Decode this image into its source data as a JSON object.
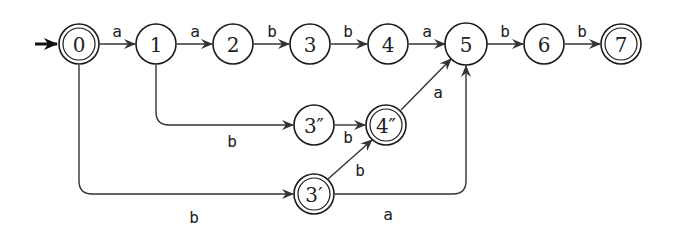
{
  "diagram": {
    "type": "finite-automaton",
    "nodes": [
      {
        "id": "0",
        "label": "0",
        "accepting": true,
        "initial": true
      },
      {
        "id": "1",
        "label": "1",
        "accepting": false
      },
      {
        "id": "2",
        "label": "2",
        "accepting": false
      },
      {
        "id": "3",
        "label": "3",
        "accepting": false
      },
      {
        "id": "4",
        "label": "4",
        "accepting": false
      },
      {
        "id": "5",
        "label": "5",
        "accepting": false
      },
      {
        "id": "6",
        "label": "6",
        "accepting": false
      },
      {
        "id": "7",
        "label": "7",
        "accepting": true
      },
      {
        "id": "3pp",
        "label": "3″",
        "accepting": false
      },
      {
        "id": "4pp",
        "label": "4″",
        "accepting": true
      },
      {
        "id": "3p",
        "label": "3′",
        "accepting": true
      }
    ],
    "edges": [
      {
        "from": "0",
        "to": "1",
        "label": "a"
      },
      {
        "from": "1",
        "to": "2",
        "label": "a"
      },
      {
        "from": "2",
        "to": "3",
        "label": "b"
      },
      {
        "from": "3",
        "to": "4",
        "label": "b"
      },
      {
        "from": "4",
        "to": "5",
        "label": "a"
      },
      {
        "from": "5",
        "to": "6",
        "label": "b"
      },
      {
        "from": "6",
        "to": "7",
        "label": "b"
      },
      {
        "from": "1",
        "to": "3pp",
        "label": "b"
      },
      {
        "from": "3pp",
        "to": "4pp",
        "label": "b"
      },
      {
        "from": "4pp",
        "to": "5",
        "label": "a"
      },
      {
        "from": "0",
        "to": "3p",
        "label": "b"
      },
      {
        "from": "3p",
        "to": "4pp",
        "label": "b"
      },
      {
        "from": "3p",
        "to": "5",
        "label": "a"
      }
    ]
  }
}
